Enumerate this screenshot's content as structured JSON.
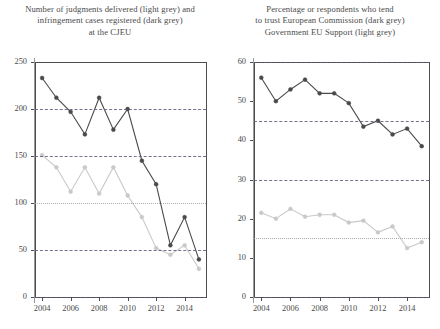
{
  "charts": [
    {
      "id": "cjeu-chart",
      "title_lines": [
        "Number of judgments delivered (light grey) and",
        "infringement cases registered (dark grey)",
        "at the CJEU"
      ],
      "ytick_labels": [
        "0",
        "50",
        "100",
        "150",
        "200",
        "250"
      ],
      "xtick_labels": [
        "2004",
        "2006",
        "2008",
        "2010",
        "2012",
        "2014"
      ],
      "chart_data": {
        "type": "line",
        "title": "Number of judgments delivered (light grey) and infringement cases registered (dark grey) at the CJEU",
        "xlabel": "",
        "ylabel": "",
        "x": [
          2004,
          2005,
          2006,
          2007,
          2008,
          2009,
          2010,
          2011,
          2012,
          2013,
          2014,
          2015
        ],
        "xlim": [
          2003.5,
          2015.5
        ],
        "ylim": [
          0,
          250
        ],
        "yticks": [
          0,
          50,
          100,
          150,
          200,
          250
        ],
        "xticks": [
          2004,
          2006,
          2008,
          2010,
          2012,
          2014
        ],
        "grid": "horizontal-dashed at 0, 50, 100, 150, 200",
        "legend": "inline in title",
        "series": [
          {
            "name": "Infringement cases registered (dark grey)",
            "color": "#4a4a4a",
            "values": [
              233,
              212,
              197,
              173,
              212,
              178,
              200,
              145,
              120,
              55,
              85,
              40
            ]
          },
          {
            "name": "Judgments delivered (light grey)",
            "color": "#c9c9c9",
            "values": [
              151,
              138,
              112,
              138,
              110,
              138,
              108,
              85,
              52,
              45,
              55,
              30
            ]
          }
        ]
      }
    },
    {
      "id": "trust-chart",
      "title_lines": [
        "Percentage or respondents who tend",
        "to trust European Commission (dark grey)",
        "Government EU Support (light grey)"
      ],
      "ytick_labels": [
        "0",
        "10",
        "20",
        "30",
        "40",
        "50",
        "60"
      ],
      "xtick_labels": [
        "2004",
        "2006",
        "2008",
        "2010",
        "2012",
        "2014"
      ],
      "chart_data": {
        "type": "line",
        "title": "Percentage or respondents who tend to trust European Commission (dark grey) Government EU Support (light grey)",
        "xlabel": "",
        "ylabel": "",
        "x": [
          2004,
          2005,
          2006,
          2007,
          2008,
          2009,
          2010,
          2011,
          2012,
          2013,
          2014,
          2015
        ],
        "xlim": [
          2003.5,
          2015.5
        ],
        "ylim": [
          0,
          60
        ],
        "yticks": [
          0,
          10,
          20,
          30,
          40,
          50,
          60
        ],
        "xticks": [
          2004,
          2006,
          2008,
          2010,
          2012,
          2014
        ],
        "grid": "horizontal-dashed at 0, 15, 30, 45, 60",
        "legend": "inline in title",
        "series": [
          {
            "name": "Tend to trust European Commission (dark grey)",
            "color": "#4a4a4a",
            "values": [
              56,
              50,
              53,
              55.5,
              52,
              52,
              49.5,
              43.5,
              45,
              41.5,
              43,
              38.5
            ]
          },
          {
            "name": "Government EU Support (light grey)",
            "color": "#c9c9c9",
            "values": [
              21.5,
              20,
              22.5,
              20.5,
              21,
              21,
              19,
              19.5,
              16.5,
              18,
              12.5,
              14
            ]
          }
        ]
      }
    }
  ]
}
